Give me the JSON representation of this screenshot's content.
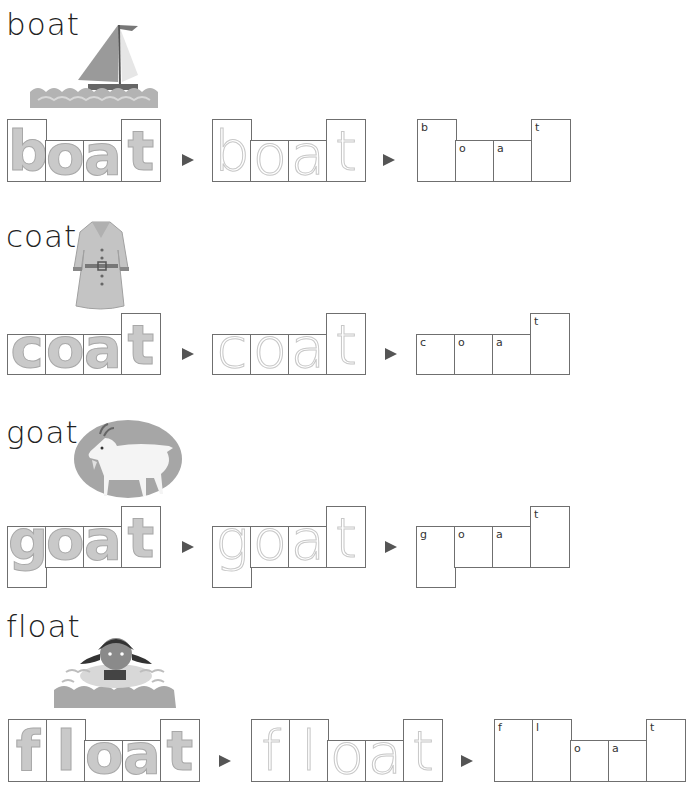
{
  "words": [
    {
      "word": "boat",
      "picture": "sailboat-on-waves",
      "letters": [
        {
          "char": "b",
          "shape": "tall"
        },
        {
          "char": "o",
          "shape": "short"
        },
        {
          "char": "a",
          "shape": "short"
        },
        {
          "char": "t",
          "shape": "tall"
        }
      ]
    },
    {
      "word": "coat",
      "picture": "belted-coat",
      "letters": [
        {
          "char": "c",
          "shape": "short"
        },
        {
          "char": "o",
          "shape": "short"
        },
        {
          "char": "a",
          "shape": "short"
        },
        {
          "char": "t",
          "shape": "tall"
        }
      ]
    },
    {
      "word": "goat",
      "picture": "white-goat",
      "letters": [
        {
          "char": "g",
          "shape": "descender"
        },
        {
          "char": "o",
          "shape": "short"
        },
        {
          "char": "a",
          "shape": "short"
        },
        {
          "char": "t",
          "shape": "tall"
        }
      ]
    },
    {
      "word": "float",
      "picture": "girl-floating-in-water",
      "letters": [
        {
          "char": "f",
          "shape": "tall"
        },
        {
          "char": "l",
          "shape": "tall"
        },
        {
          "char": "o",
          "shape": "short"
        },
        {
          "char": "a",
          "shape": "short"
        },
        {
          "char": "t",
          "shape": "tall"
        }
      ]
    }
  ],
  "icons": {
    "arrow": "right-triangle-arrow"
  }
}
